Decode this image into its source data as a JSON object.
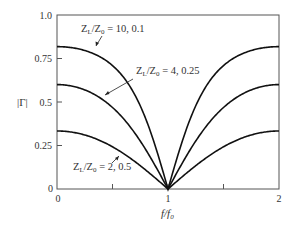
{
  "chart_data": {
    "type": "line",
    "title": "",
    "xlabel": "f/f0",
    "ylabel": "|Γ|",
    "xlim": [
      0,
      2
    ],
    "ylim": [
      0,
      1.0
    ],
    "grid": false,
    "legend": "none (inline annotations with arrows)",
    "x_ticks": [
      0,
      0.5,
      1,
      1.5,
      2
    ],
    "x_tick_labels": [
      "0",
      "",
      "1",
      "",
      "2"
    ],
    "y_ticks": [
      0,
      0.25,
      0.5,
      0.75,
      1.0
    ],
    "y_tick_labels": [
      "0",
      "0.25",
      "0.5",
      "0.75",
      "1.0"
    ],
    "x": [
      0,
      0.1,
      0.2,
      0.3,
      0.4,
      0.5,
      0.6,
      0.7,
      0.8,
      0.9,
      1.0,
      1.1,
      1.2,
      1.3,
      1.4,
      1.5,
      1.6,
      1.7,
      1.8,
      1.9,
      2.0
    ],
    "series": [
      {
        "name": "ZL/Z0 = 10, 0.1",
        "ratio": 10,
        "values": [
          0.818,
          0.814,
          0.8,
          0.777,
          0.742,
          0.691,
          0.618,
          0.515,
          0.376,
          0.201,
          0.0,
          0.201,
          0.376,
          0.515,
          0.618,
          0.691,
          0.742,
          0.777,
          0.8,
          0.814,
          0.818
        ]
      },
      {
        "name": "ZL/Z0 = 4, 0.25",
        "ratio": 4,
        "values": [
          0.6,
          0.595,
          0.579,
          0.552,
          0.512,
          0.457,
          0.386,
          0.299,
          0.202,
          0.101,
          0.0,
          0.101,
          0.202,
          0.299,
          0.386,
          0.457,
          0.512,
          0.552,
          0.579,
          0.595,
          0.6
        ]
      },
      {
        "name": "ZL/Z0 = 2, 0.5",
        "ratio": 2,
        "values": [
          0.333,
          0.33,
          0.319,
          0.301,
          0.275,
          0.242,
          0.2,
          0.15,
          0.097,
          0.048,
          0.0,
          0.048,
          0.097,
          0.15,
          0.2,
          0.242,
          0.275,
          0.301,
          0.319,
          0.33,
          0.333
        ]
      }
    ],
    "annotations": [
      {
        "text_main": "Z",
        "sub1": "L",
        "mid": "/Z",
        "sub2": "0",
        "rest": " = 10, 0.1"
      },
      {
        "text_main": "Z",
        "sub1": "L",
        "mid": "/Z",
        "sub2": "0",
        "rest": " = 4, 0.25"
      },
      {
        "text_main": "Z",
        "sub1": "L",
        "mid": "/Z",
        "sub2": "0",
        "rest": " = 2, 0.5"
      }
    ],
    "xlabel_parts": {
      "main": "f/f",
      "sub": "0"
    },
    "ylabel_text": "|Γ|"
  },
  "colors": {
    "axis": "#555555",
    "curve": "#111111",
    "text": "#333333"
  }
}
